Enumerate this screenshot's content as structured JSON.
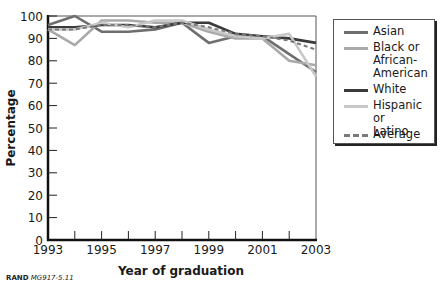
{
  "chart_data": {
    "type": "line",
    "title": "",
    "xlabel": "Year of graduation",
    "ylabel": "Percentage",
    "x": [
      1993,
      1994,
      1995,
      1996,
      1997,
      1998,
      1999,
      2000,
      2001,
      2002,
      2003
    ],
    "x_tick_labels": [
      "1993",
      "1995",
      "1997",
      "1999",
      "2001",
      "2003"
    ],
    "y_tick_labels": [
      "0",
      "10",
      "20",
      "30",
      "40",
      "50",
      "60",
      "70",
      "80",
      "90",
      "100"
    ],
    "ylim": [
      0,
      100
    ],
    "xlim": [
      1993,
      2003
    ],
    "grid": false,
    "legend_position": "right",
    "series": [
      {
        "name": "Asian",
        "color": "#6e6e6e",
        "dash": false,
        "values": [
          96,
          100,
          93,
          93,
          94,
          97,
          88,
          91,
          91,
          83,
          75
        ]
      },
      {
        "name": "Black or African-American",
        "color": "#a9a9a9",
        "dash": false,
        "values": [
          94,
          87,
          98,
          98,
          97,
          97,
          93,
          90,
          90,
          80,
          78
        ]
      },
      {
        "name": "White",
        "color": "#3a3a3a",
        "dash": false,
        "values": [
          95,
          95,
          96,
          96,
          95,
          97,
          97,
          92,
          91,
          90,
          88
        ]
      },
      {
        "name": "Hispanic or Latino",
        "color": "#c8c8c8",
        "dash": false,
        "values": [
          94,
          94,
          97,
          95,
          98,
          98,
          94,
          91,
          90,
          92,
          73
        ]
      },
      {
        "name": "Average",
        "color": "#7a7a7a",
        "dash": true,
        "values": [
          94,
          94,
          96,
          96,
          95,
          97,
          95,
          92,
          91,
          89,
          85
        ]
      }
    ]
  },
  "legend": {
    "items": [
      {
        "label_lines": [
          "Asian"
        ],
        "color": "#6e6e6e",
        "style": "solid"
      },
      {
        "label_lines": [
          "Black or",
          "African-",
          "American"
        ],
        "color": "#a9a9a9",
        "style": "solid"
      },
      {
        "label_lines": [
          "White"
        ],
        "color": "#3a3a3a",
        "style": "solid"
      },
      {
        "label_lines": [
          "Hispanic or",
          "Latino"
        ],
        "color": "#c8c8c8",
        "style": "solid"
      },
      {
        "label_lines": [
          "Average"
        ],
        "color": "#7a7a7a",
        "style": "dashed"
      }
    ]
  },
  "source": {
    "org": "RAND",
    "id": "MG917-5.11"
  }
}
